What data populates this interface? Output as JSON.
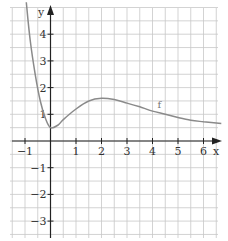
{
  "chart_data": {
    "type": "line",
    "title": "",
    "xlabel": "x",
    "ylabel": "y",
    "xlim": [
      -1.5,
      6.7
    ],
    "ylim": [
      -3.6,
      5.2
    ],
    "grid": true,
    "grid_step": 0.5,
    "x_ticks": [
      -1,
      1,
      2,
      3,
      4,
      5,
      6
    ],
    "x_tick_labels": [
      "−1",
      "1",
      "2",
      "3",
      "4",
      "5",
      "6"
    ],
    "y_ticks": [
      4,
      3,
      2,
      1,
      -1,
      -2,
      -3
    ],
    "y_tick_labels": [
      "4",
      "3",
      "2",
      "1",
      "−1",
      "−2",
      "−3"
    ],
    "series": [
      {
        "name": "f",
        "color": "#8a8a8a",
        "x": [
          -0.95,
          -0.8,
          -0.6,
          -0.4,
          -0.2,
          0,
          0.3,
          0.5,
          1,
          1.5,
          2,
          2.5,
          3,
          3.5,
          4,
          4.5,
          5,
          5.5,
          6,
          6.7
        ],
        "y": [
          5.2,
          3.8,
          2.5,
          1.5,
          0.85,
          0.5,
          0.6,
          0.8,
          1.2,
          1.5,
          1.6,
          1.55,
          1.42,
          1.28,
          1.12,
          1.0,
          0.88,
          0.78,
          0.72,
          0.66
        ]
      }
    ],
    "annotations": [
      {
        "text": "f",
        "x": 4.2,
        "y": 1.25
      }
    ]
  },
  "labels": {
    "x_axis": "x",
    "y_axis": "y",
    "curve_name": "f"
  }
}
